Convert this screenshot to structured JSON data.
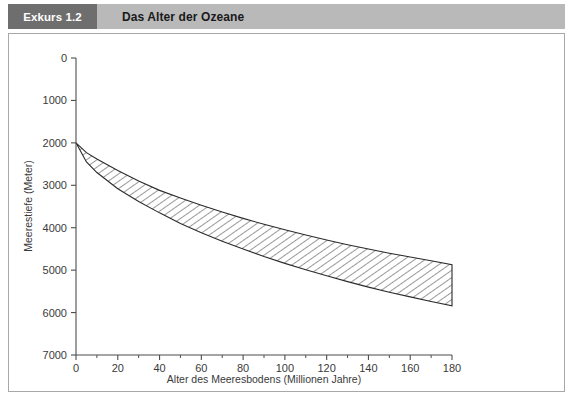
{
  "header": {
    "tag_label": "Exkurs 1.2",
    "title": "Das Alter der Ozeane",
    "tag_bg": "#6e6e6e",
    "title_bg": "#b9b9b9",
    "tag_text_color": "#ffffff"
  },
  "chart_data": {
    "type": "area",
    "title": "Das Alter der Ozeane",
    "xlabel": "Alter des Meeresbodens (Millionen Jahre)",
    "ylabel": "Meerestiefe (Meter)",
    "xlim": [
      0,
      180
    ],
    "ylim": [
      0,
      7000
    ],
    "y_inverted": true,
    "grid": false,
    "legend": null,
    "xticks": [
      0,
      20,
      40,
      60,
      80,
      100,
      120,
      140,
      160,
      180
    ],
    "xtick_labels": [
      "0",
      "20",
      "40",
      "60",
      "80",
      "100",
      "120",
      "140",
      "160",
      "180"
    ],
    "x_minor_ticks": [
      10,
      30,
      50,
      70,
      90,
      110,
      130,
      150,
      170
    ],
    "yticks": [
      0,
      1000,
      2000,
      3000,
      4000,
      5000,
      6000,
      7000
    ],
    "ytick_labels": [
      "0",
      "1000",
      "2000",
      "3000",
      "4000",
      "5000",
      "6000",
      "7000"
    ],
    "fill_style": "diagonal-hatch",
    "fill_color": "#3a3a3a",
    "outline_color": "#2b2b2b",
    "x": [
      0,
      5,
      10,
      20,
      30,
      40,
      50,
      60,
      70,
      80,
      90,
      100,
      110,
      120,
      130,
      140,
      150,
      160,
      170,
      180
    ],
    "series": [
      {
        "name": "Obere Begrenzung (geringste Meerestiefe)",
        "values": [
          2000,
          2230,
          2380,
          2650,
          2900,
          3120,
          3300,
          3470,
          3630,
          3780,
          3920,
          4050,
          4170,
          4290,
          4400,
          4500,
          4600,
          4690,
          4780,
          4870
        ]
      },
      {
        "name": "Untere Begrenzung (groesste Meerestiefe)",
        "values": [
          2000,
          2450,
          2700,
          3080,
          3380,
          3650,
          3900,
          4120,
          4320,
          4500,
          4680,
          4840,
          4990,
          5130,
          5270,
          5400,
          5520,
          5630,
          5740,
          5840
        ]
      }
    ]
  }
}
